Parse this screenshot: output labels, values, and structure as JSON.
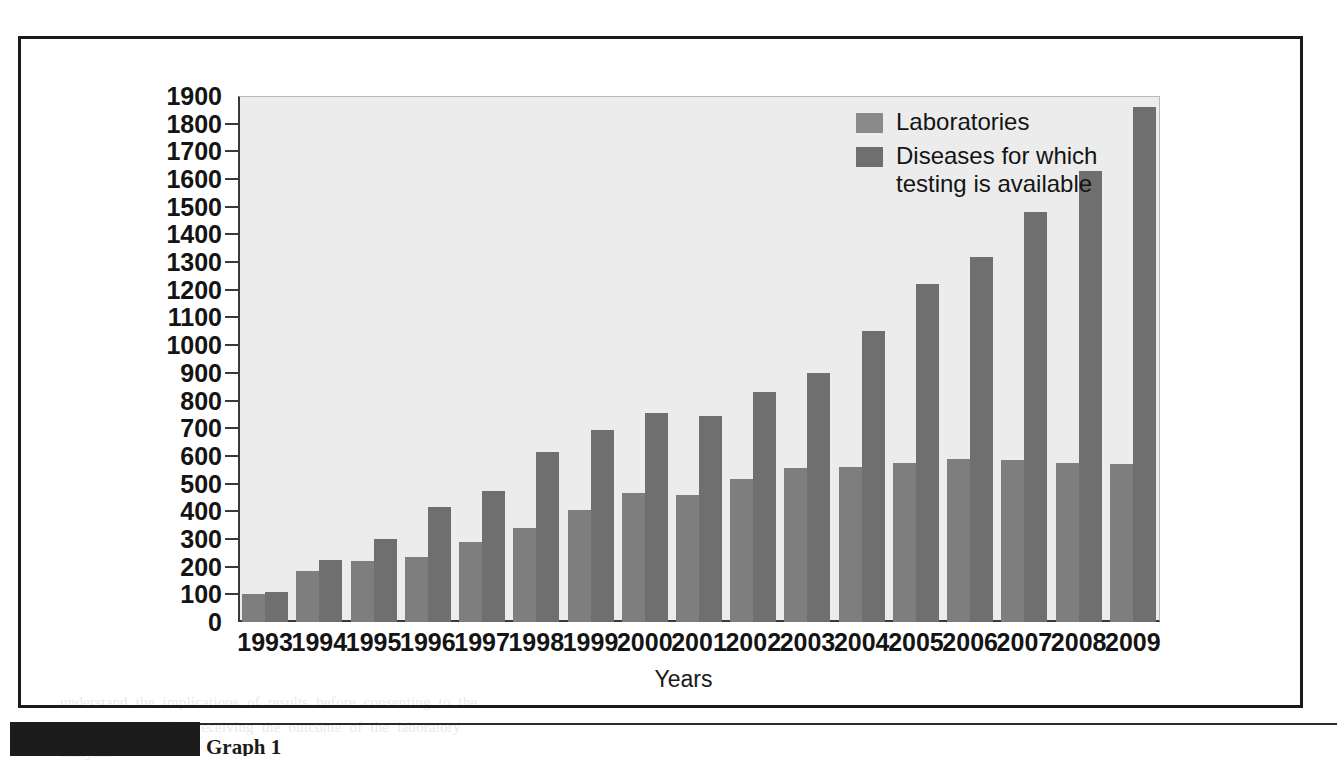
{
  "chart_data": {
    "type": "bar",
    "title": "",
    "xlabel": "Years",
    "ylabel": "",
    "ylim": [
      0,
      1900
    ],
    "ytick_step": 100,
    "grid": false,
    "legend_position": "top-right",
    "categories": [
      "1993",
      "1994",
      "1995",
      "1996",
      "1997",
      "1998",
      "1999",
      "2000",
      "2001",
      "2002",
      "2003",
      "2004",
      "2005",
      "2006",
      "2007",
      "2008",
      "2009"
    ],
    "yticks": [
      "1900",
      "1800",
      "1700",
      "1600",
      "1500",
      "1400",
      "1300",
      "1200",
      "1100",
      "1000",
      "900",
      "800",
      "700",
      "600",
      "500",
      "400",
      "300",
      "200",
      "100",
      "0"
    ],
    "series": [
      {
        "name": "Laboratories",
        "color": "#7e7e7e",
        "values": [
          100,
          185,
          220,
          235,
          290,
          340,
          405,
          465,
          460,
          515,
          555,
          560,
          575,
          590,
          585,
          575,
          570
        ]
      },
      {
        "name": "Diseases for which\ntesting is available",
        "color": "#6f6f6f",
        "values": [
          110,
          225,
          300,
          415,
          475,
          615,
          695,
          755,
          745,
          830,
          900,
          1050,
          1220,
          1320,
          1480,
          1630,
          1860
        ]
      }
    ]
  },
  "legend": {
    "items": [
      {
        "label": "Laboratories",
        "swatch": "legend-swatch-laboratories"
      },
      {
        "label": "Diseases for which\ntesting is available",
        "swatch": "legend-swatch-diseases"
      }
    ]
  },
  "axes": {
    "x_title": "Years"
  },
  "page": {
    "caption_sliver": "Graph 1",
    "bleed_lines": [
      "considerable  uncertainty  surrounding  the  genetic  testing  for  rare  disorders",
      "and treatment options",
      "targets are specified, the  gene  tests  indicate  the  presence  of",
      "disease-causing  mutations  or  polymorphisms  linked  to  the  risk",
      "of  genetic  disorder.  The  clinical  utility  is  considered  as  the",
      "probability  of  a  positive  result  and  whether  an  informed",
      "decision  can  be  made.  Genetic  counseling  in  many  instances",
      "accompanies  the  testing  process  so  that  an  individual  may",
      "understand  the  implications  of  results  before  consenting  to  the",
      "procedure  and  after  receiving  the  outcome  of  the  laboratory",
      "analysis."
    ]
  },
  "colors": {
    "plot_background": "#ececec",
    "axis": "#3a3a3a",
    "frame": "#1a1a1a",
    "laboratories": "#7e7e7e",
    "diseases": "#6f6f6f"
  }
}
